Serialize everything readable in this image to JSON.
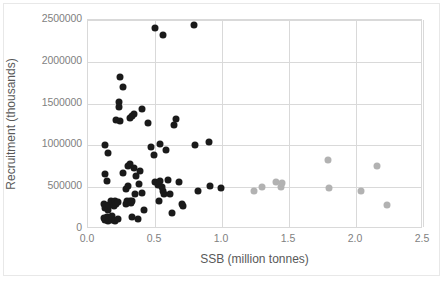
{
  "chart_data": {
    "type": "scatter",
    "title": "",
    "xlabel": "SSB (million tonnes)",
    "ylabel": "Recruitment (thousands)",
    "xlim": [
      0.0,
      2.5
    ],
    "ylim": [
      0,
      2500000
    ],
    "xticks": [
      "0.0",
      "0.5",
      "1.0",
      "1.5",
      "2.0",
      "2.5"
    ],
    "xtick_values": [
      0.0,
      0.5,
      1.0,
      1.5,
      2.0,
      2.5
    ],
    "yticks": [
      "0",
      "500000",
      "1000000",
      "1500000",
      "2000000",
      "2500000"
    ],
    "ytick_values": [
      0,
      500000,
      1000000,
      1500000,
      2000000,
      2500000
    ],
    "grid": "both",
    "legend": "none",
    "series": [
      {
        "name": "historical-observations",
        "color": "#1a1a1a",
        "marker": "filled-circle",
        "points": [
          [
            0.13,
            1010000
          ],
          [
            0.15,
            910000
          ],
          [
            0.13,
            660000
          ],
          [
            0.14,
            580000
          ],
          [
            0.12,
            300000
          ],
          [
            0.13,
            250000
          ],
          [
            0.15,
            230000
          ],
          [
            0.14,
            150000
          ],
          [
            0.12,
            130000
          ],
          [
            0.13,
            110000
          ],
          [
            0.15,
            100000
          ],
          [
            0.16,
            120000
          ],
          [
            0.17,
            140000
          ],
          [
            0.18,
            160000
          ],
          [
            0.16,
            290000
          ],
          [
            0.17,
            330000
          ],
          [
            0.19,
            280000
          ],
          [
            0.2,
            330000
          ],
          [
            0.21,
            300000
          ],
          [
            0.22,
            320000
          ],
          [
            0.18,
            105000
          ],
          [
            0.2,
            95000
          ],
          [
            0.22,
            120000
          ],
          [
            0.24,
            1820000
          ],
          [
            0.26,
            1700000
          ],
          [
            0.23,
            1520000
          ],
          [
            0.23,
            1460000
          ],
          [
            0.24,
            1290000
          ],
          [
            0.21,
            1310000
          ],
          [
            0.26,
            670000
          ],
          [
            0.28,
            480000
          ],
          [
            0.3,
            520000
          ],
          [
            0.29,
            330000
          ],
          [
            0.31,
            340000
          ],
          [
            0.28,
            300000
          ],
          [
            0.32,
            310000
          ],
          [
            0.33,
            330000
          ],
          [
            0.31,
            1330000
          ],
          [
            0.33,
            1350000
          ],
          [
            0.34,
            1380000
          ],
          [
            0.3,
            760000
          ],
          [
            0.31,
            780000
          ],
          [
            0.34,
            730000
          ],
          [
            0.36,
            640000
          ],
          [
            0.35,
            420000
          ],
          [
            0.33,
            150000
          ],
          [
            0.37,
            120000
          ],
          [
            0.4,
            1440000
          ],
          [
            0.39,
            700000
          ],
          [
            0.38,
            540000
          ],
          [
            0.4,
            430000
          ],
          [
            0.42,
            230000
          ],
          [
            0.45,
            1270000
          ],
          [
            0.47,
            980000
          ],
          [
            0.49,
            890000
          ],
          [
            0.5,
            560000
          ],
          [
            0.52,
            530000
          ],
          [
            0.54,
            580000
          ],
          [
            0.55,
            500000
          ],
          [
            0.56,
            450000
          ],
          [
            0.57,
            420000
          ],
          [
            0.53,
            330000
          ],
          [
            0.5,
            2400000
          ],
          [
            0.56,
            2320000
          ],
          [
            0.54,
            1020000
          ],
          [
            0.58,
            950000
          ],
          [
            0.6,
            590000
          ],
          [
            0.61,
            420000
          ],
          [
            0.63,
            190000
          ],
          [
            0.64,
            1250000
          ],
          [
            0.66,
            1320000
          ],
          [
            0.68,
            560000
          ],
          [
            0.7,
            300000
          ],
          [
            0.71,
            280000
          ],
          [
            0.79,
            2440000
          ],
          [
            0.8,
            1010000
          ],
          [
            0.82,
            450000
          ],
          [
            0.9,
            1040000
          ],
          [
            0.91,
            520000
          ],
          [
            0.99,
            490000
          ]
        ]
      },
      {
        "name": "projected-observations",
        "color": "#b2b2b2",
        "marker": "filled-circle",
        "points": [
          [
            1.24,
            450000
          ],
          [
            1.3,
            500000
          ],
          [
            1.4,
            560000
          ],
          [
            1.44,
            500000
          ],
          [
            1.45,
            550000
          ],
          [
            1.79,
            830000
          ],
          [
            1.8,
            490000
          ],
          [
            2.04,
            450000
          ],
          [
            2.16,
            760000
          ],
          [
            2.23,
            290000
          ]
        ]
      }
    ]
  },
  "axes": {
    "x_title": "SSB (million tonnes)",
    "y_title": "Recruitment (thousands)"
  }
}
